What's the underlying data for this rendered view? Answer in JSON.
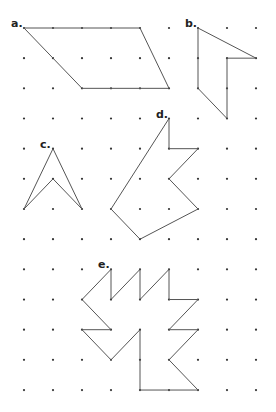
{
  "grid": {
    "cols": 9,
    "rows": 13,
    "origin_x": 24,
    "origin_y": 28,
    "spacing_x": 29,
    "spacing_y": 30.17,
    "dot_color": "#333333",
    "line_color": "#555555"
  },
  "shapes": [
    {
      "label": "a.",
      "label_pos": [
        0,
        0
      ],
      "points": [
        [
          0,
          0
        ],
        [
          4,
          0
        ],
        [
          5,
          2
        ],
        [
          2,
          2
        ]
      ]
    },
    {
      "label": "b.",
      "label_pos": [
        6,
        0
      ],
      "points": [
        [
          6,
          0
        ],
        [
          8,
          1
        ],
        [
          7,
          1
        ],
        [
          7,
          3
        ],
        [
          6,
          2
        ]
      ]
    },
    {
      "label": "c.",
      "label_pos": [
        1,
        4
      ],
      "points": [
        [
          1,
          4
        ],
        [
          2,
          6
        ],
        [
          1,
          5
        ],
        [
          0,
          6
        ]
      ]
    },
    {
      "label": "d.",
      "label_pos": [
        5,
        3
      ],
      "points": [
        [
          5,
          3
        ],
        [
          5,
          4
        ],
        [
          6,
          4
        ],
        [
          5,
          5
        ],
        [
          6,
          6
        ],
        [
          4,
          7
        ],
        [
          3,
          6
        ]
      ]
    },
    {
      "label": "e.",
      "label_pos": [
        3,
        8
      ],
      "points": [
        [
          3,
          8
        ],
        [
          3,
          9
        ],
        [
          4,
          8
        ],
        [
          4,
          9
        ],
        [
          5,
          8
        ],
        [
          5,
          9
        ],
        [
          6,
          9
        ],
        [
          5,
          10
        ],
        [
          6,
          10
        ],
        [
          5,
          11
        ],
        [
          6,
          12
        ],
        [
          4,
          12
        ],
        [
          4,
          10
        ],
        [
          3,
          11
        ],
        [
          2,
          10
        ],
        [
          3,
          10
        ],
        [
          2,
          9
        ]
      ]
    }
  ]
}
